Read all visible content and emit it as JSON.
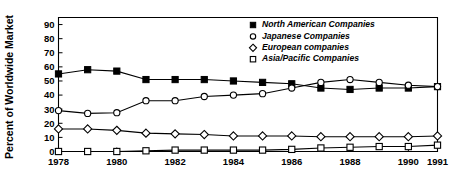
{
  "chart_data": {
    "type": "line",
    "title": "",
    "xlabel": "",
    "ylabel": "Percent of Worldwide Market",
    "x": [
      1978,
      1979,
      1980,
      1981,
      1982,
      1983,
      1984,
      1985,
      1986,
      1987,
      1988,
      1989,
      1990,
      1991
    ],
    "xlim": [
      1978,
      1991
    ],
    "ylim": [
      0,
      95
    ],
    "yticks": [
      0,
      10,
      20,
      30,
      40,
      50,
      60,
      70,
      80,
      90
    ],
    "xticks": [
      1978,
      1980,
      1982,
      1984,
      1986,
      1988,
      1990,
      1991
    ],
    "xticklabels": [
      "1978",
      "1980",
      "1982",
      "1984",
      "1986",
      "1988",
      "1990",
      "1991"
    ],
    "yticklabels": [
      "0",
      "10",
      "20",
      "30",
      "40",
      "50",
      "60",
      "70",
      "80",
      "90"
    ],
    "grid": false,
    "legend_position": "top-right",
    "series": [
      {
        "name": "North American Companies",
        "marker": "filled-square",
        "values": [
          55,
          58,
          57,
          51,
          51,
          51,
          50,
          49,
          48,
          45,
          44,
          45,
          45,
          46
        ]
      },
      {
        "name": "Japanese Companies",
        "marker": "open-circle",
        "values": [
          29,
          27,
          27.5,
          36,
          36,
          39,
          40,
          41,
          45,
          49,
          51,
          49,
          47,
          46
        ]
      },
      {
        "name": "European companies",
        "marker": "open-diamond",
        "values": [
          16,
          16,
          15,
          13,
          12.5,
          12,
          11,
          11,
          11,
          10.5,
          10.5,
          10.5,
          10.5,
          11
        ]
      },
      {
        "name": "Asia/Pacific Companies",
        "marker": "open-square",
        "values": [
          0,
          0,
          0,
          0.5,
          1,
          1,
          1,
          1,
          1.5,
          2.5,
          3,
          3.5,
          3.5,
          4.5
        ]
      }
    ]
  },
  "legend": {
    "entries": [
      {
        "label": "North American Companies",
        "marker": "filled-square"
      },
      {
        "label": "Japanese Companies",
        "marker": "open-circle"
      },
      {
        "label": "European companies",
        "marker": "open-diamond"
      },
      {
        "label": "Asia/Pacific Companies",
        "marker": "open-square"
      }
    ]
  },
  "axes": {
    "y_axis_title": "Percent of Worldwide Market"
  }
}
